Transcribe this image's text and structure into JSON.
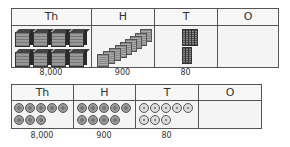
{
  "diagram": {
    "columns": [
      "Th",
      "H",
      "T",
      "O"
    ],
    "top_table": {
      "representation": "base-ten blocks",
      "cells": [
        {
          "column": "Th",
          "item": "thousand-cube",
          "count": 8,
          "value_label": "8,000"
        },
        {
          "column": "H",
          "item": "hundred-flat",
          "count": 9,
          "value_label": "900"
        },
        {
          "column": "T",
          "item": "ten-rod",
          "count": 8,
          "value_label": "80"
        },
        {
          "column": "O",
          "item": "one-unit",
          "count": 0,
          "value_label": ""
        }
      ]
    },
    "bottom_table": {
      "representation": "place value counters",
      "cells": [
        {
          "column": "Th",
          "item": "thousand-counter",
          "count": 8,
          "value_label": "8,000"
        },
        {
          "column": "H",
          "item": "hundred-counter",
          "count": 9,
          "value_label": "900"
        },
        {
          "column": "T",
          "item": "ten-counter",
          "count": 8,
          "value_label": "80"
        },
        {
          "column": "O",
          "item": "one-counter",
          "count": 0,
          "value_label": ""
        }
      ]
    },
    "colors": {
      "border": "#555555",
      "cell_bg": "#f4f4f4",
      "dark_counter": "#999999",
      "light_counter": "#dddddd"
    }
  }
}
